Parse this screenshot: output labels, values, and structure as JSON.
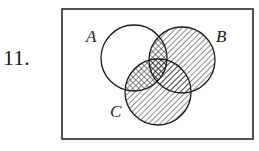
{
  "problem": {
    "number": "11."
  },
  "diagram": {
    "type": "venn",
    "sets": [
      {
        "label": "A",
        "shading": "none"
      },
      {
        "label": "B",
        "shading": "hatched"
      },
      {
        "label": "C",
        "shading": "hatched"
      }
    ],
    "regions": {
      "A_only": "unshaded",
      "A_and_B": "cross-hatched",
      "A_and_C": "cross-hatched",
      "B_outside_A": "hatched",
      "C_outside_A": "hatched"
    },
    "stroke_color": "#1a1a1a",
    "background": "#ffffff"
  }
}
